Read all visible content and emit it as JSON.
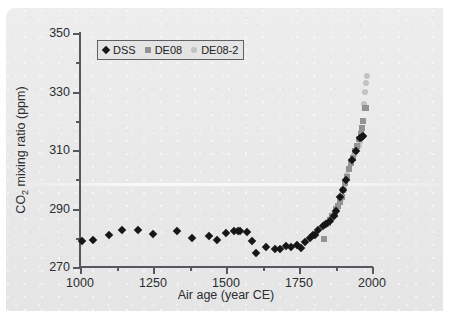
{
  "figure": {
    "background_color": "#e9e9e9",
    "page_color": "#ffffff"
  },
  "chart_data": {
    "type": "scatter",
    "title": "",
    "xlabel": "Air age (year CE)",
    "ylabel": "CO2 mixing ratio (ppm)",
    "ylabel_prefix": "CO",
    "ylabel_sub": "2",
    "ylabel_suffix": " mixing ratio (ppm)",
    "xlim": [
      1000,
      2000
    ],
    "ylim": [
      270,
      350
    ],
    "grid": false,
    "legend_position": "upper left",
    "xticks": [
      1000,
      1250,
      1500,
      1750,
      2000
    ],
    "xtick_labels": [
      "1000",
      "1250",
      "1500",
      "1750",
      "2000"
    ],
    "xticks_minor": [
      1125,
      1375,
      1625,
      1875
    ],
    "yticks": [
      270,
      290,
      310,
      330,
      350
    ],
    "ytick_labels": [
      "270",
      "290",
      "310",
      "330",
      "350"
    ],
    "yticks_minor": [
      280,
      300,
      320,
      340
    ],
    "series": [
      {
        "name": "DSS",
        "marker": "diamond",
        "color": "#141618",
        "points": [
          [
            1006,
            279.0
          ],
          [
            1046,
            279.3
          ],
          [
            1098,
            281.0
          ],
          [
            1143,
            282.6
          ],
          [
            1197,
            282.5
          ],
          [
            1249,
            281.2
          ],
          [
            1333,
            282.3
          ],
          [
            1382,
            279.8
          ],
          [
            1443,
            280.5
          ],
          [
            1468,
            279.3
          ],
          [
            1500,
            281.6
          ],
          [
            1527,
            282.3
          ],
          [
            1540,
            282.4
          ],
          [
            1548,
            282.2
          ],
          [
            1572,
            281.8
          ],
          [
            1588,
            279.0
          ],
          [
            1604,
            274.7
          ],
          [
            1638,
            277.0
          ],
          [
            1668,
            276.2
          ],
          [
            1686,
            276.3
          ],
          [
            1705,
            277.1
          ],
          [
            1722,
            277.0
          ],
          [
            1742,
            277.4
          ],
          [
            1756,
            276.4
          ],
          [
            1772,
            278.4
          ],
          [
            1789,
            280.0
          ],
          [
            1797,
            281.1
          ],
          [
            1804,
            281.0
          ],
          [
            1816,
            282.8
          ],
          [
            1831,
            284.0
          ],
          [
            1842,
            284.6
          ],
          [
            1856,
            285.6
          ],
          [
            1869,
            287.3
          ],
          [
            1878,
            289.1
          ],
          [
            1890,
            294.0
          ],
          [
            1900,
            296.4
          ],
          [
            1912,
            299.9
          ],
          [
            1930,
            306.5
          ],
          [
            1944,
            309.6
          ],
          [
            1959,
            314.0
          ],
          [
            1966,
            314.6
          ],
          [
            1969,
            314.9
          ]
        ]
      },
      {
        "name": "DE08",
        "marker": "square",
        "color": "#919395",
        "points": [
          [
            1834,
            279.6
          ],
          [
            1842,
            284.7
          ],
          [
            1848,
            285.0
          ],
          [
            1856,
            286.2
          ],
          [
            1864,
            287.5
          ],
          [
            1872,
            288.0
          ],
          [
            1878,
            289.9
          ],
          [
            1884,
            291.0
          ],
          [
            1890,
            292.2
          ],
          [
            1896,
            294.0
          ],
          [
            1902,
            296.2
          ],
          [
            1908,
            298.8
          ],
          [
            1914,
            300.8
          ],
          [
            1921,
            303.4
          ],
          [
            1928,
            305.6
          ],
          [
            1936,
            307.2
          ],
          [
            1943,
            309.5
          ],
          [
            1950,
            311.5
          ],
          [
            1957,
            313.6
          ],
          [
            1962,
            315.6
          ],
          [
            1966,
            317.4
          ],
          [
            1970,
            319.8
          ],
          [
            1975,
            324.2
          ],
          [
            1978,
            324.3
          ]
        ]
      },
      {
        "name": "DE08-2",
        "marker": "circle",
        "color": "#c0c2c4",
        "points": [
          [
            1846,
            285.4
          ],
          [
            1858,
            286.7
          ],
          [
            1870,
            288.6
          ],
          [
            1882,
            290.6
          ],
          [
            1893,
            293.2
          ],
          [
            1904,
            297.0
          ],
          [
            1916,
            301.6
          ],
          [
            1927,
            305.4
          ],
          [
            1938,
            308.3
          ],
          [
            1948,
            310.6
          ],
          [
            1955,
            311.4
          ],
          [
            1960,
            312.6
          ],
          [
            1964,
            316.2
          ],
          [
            1969,
            320.0
          ],
          [
            1973,
            325.6
          ],
          [
            1977,
            329.8
          ],
          [
            1981,
            333.0
          ],
          [
            1984,
            335.3
          ]
        ]
      }
    ]
  },
  "legend": {
    "entries": [
      {
        "label": "DSS",
        "marker": "diamond-icon",
        "color": "#141618"
      },
      {
        "label": "DE08",
        "marker": "square-icon",
        "color": "#919395"
      },
      {
        "label": "DE08-2",
        "marker": "circle-icon",
        "color": "#c0c2c4"
      }
    ]
  }
}
